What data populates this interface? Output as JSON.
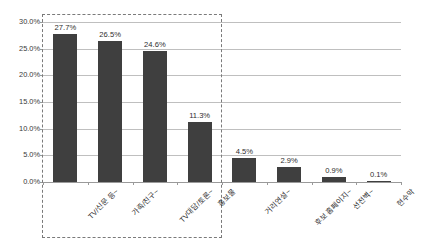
{
  "chart_data": {
    "type": "bar",
    "title": "",
    "xlabel": "",
    "ylabel": "",
    "ylim": [
      0,
      30
    ],
    "grid": true,
    "legend": "none",
    "categories": [
      "TV/신문 등~",
      "가족/친구~",
      "TV대담/토론~",
      "홍보물",
      "거리연설~",
      "후보 홈페이지~",
      "선전벽~",
      "현수막"
    ],
    "values": [
      27.7,
      26.5,
      24.6,
      11.3,
      4.5,
      2.9,
      0.9,
      0.1
    ],
    "value_labels": [
      "27.7%",
      "26.5%",
      "24.6%",
      "11.3%",
      "4.5%",
      "2.9%",
      "0.9%",
      "0.1%"
    ],
    "y_ticks": [
      0,
      5,
      10,
      15,
      20,
      25,
      30
    ],
    "y_tick_labels": [
      "0.0%",
      "5.0%",
      "10.0%",
      "15.0%",
      "20.0%",
      "25.0%",
      "30.0%"
    ],
    "bar_color": "#3f3f3f",
    "gridline_color": "#bfbfbf",
    "axis_color": "#9a9a9a",
    "highlight_color": "#7a7a7a",
    "highlighted_categories": [
      "TV/신문 등~",
      "가족/친구~",
      "TV대담/토론~",
      "홍보물"
    ]
  }
}
